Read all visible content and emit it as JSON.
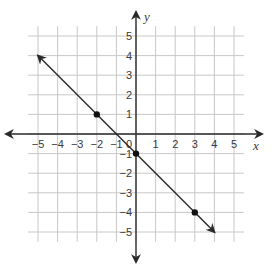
{
  "chart_data": {
    "type": "line",
    "title": "",
    "xlabel": "x",
    "ylabel": "y",
    "xlim": [
      -5,
      5
    ],
    "ylim": [
      -5,
      5
    ],
    "grid": true,
    "x_ticks": [
      -5,
      -4,
      -3,
      -2,
      -1,
      0,
      1,
      2,
      3,
      4,
      5
    ],
    "y_ticks": [
      -5,
      -4,
      -3,
      -2,
      -1,
      1,
      2,
      3,
      4,
      5
    ],
    "x_tick_labels": [
      "−5",
      "−4",
      "−3",
      "−2",
      "−1",
      "1",
      "2",
      "3",
      "4",
      "5"
    ],
    "y_tick_labels": [
      "5",
      "4",
      "3",
      "2",
      "1",
      "−1",
      "−2",
      "−3",
      "−4",
      "−5"
    ],
    "origin_label": "0",
    "series": [
      {
        "name": "line",
        "equation": "y = -x - 1",
        "slope": -1,
        "intercept": -1,
        "line_from": [
          -5,
          4
        ],
        "line_to": [
          4,
          -5
        ],
        "arrows_both_ends": true,
        "points": [
          [
            -2,
            1
          ],
          [
            0,
            -1
          ],
          [
            3,
            -4
          ]
        ]
      }
    ]
  },
  "colors": {
    "grid": "#c8c8c8",
    "axis": "#2a2a2a",
    "line": "#2a2a2a",
    "point": "#111111",
    "text": "#3a3a3a"
  }
}
